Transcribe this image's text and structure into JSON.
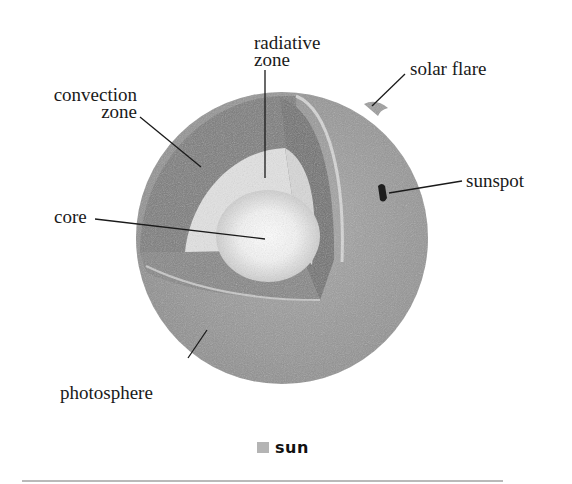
{
  "diagram": {
    "subject": "sun",
    "labels": {
      "radiative_zone": [
        "radiative",
        "zone"
      ],
      "convection_zone": [
        "convection",
        "zone"
      ],
      "solar_flare": "solar flare",
      "sunspot": "sunspot",
      "core": "core",
      "photosphere": "photosphere"
    },
    "colors": {
      "outer_surface": "#9a9a9a",
      "convection": "#7d7d7d",
      "radiative": "#e6e6e6",
      "core": "#ffffff",
      "sunspot": "#1e1e1e",
      "legend_swatch": "#b4b4b4",
      "divider": "#b9b9b9"
    }
  },
  "legend": {
    "label": "sun"
  }
}
